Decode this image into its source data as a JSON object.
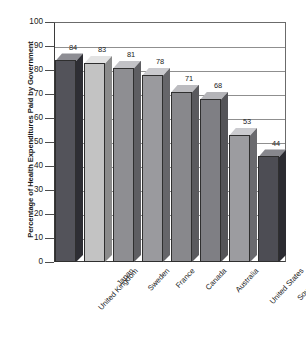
{
  "chart_data": {
    "type": "bar",
    "title": "",
    "subtitle": "",
    "xlabel": "",
    "ylabel": "Percentage of Health Expenditures Paid by Government",
    "ylim": [
      0,
      100
    ],
    "ytick_step": 10,
    "yticks": [
      "100",
      "90",
      "80",
      "70",
      "60",
      "50",
      "40",
      "30",
      "20",
      "10",
      "0"
    ],
    "grid": true,
    "grid_axis": "y",
    "legend": "none",
    "style": "3d-bar",
    "categories": [
      "United Kingdom",
      "Japan",
      "Sweden",
      "France",
      "Canada",
      "Australia",
      "United States",
      "South Africa"
    ],
    "values": [
      84,
      83,
      81,
      78,
      71,
      68,
      53,
      44
    ],
    "data_labels": [
      "84",
      "83",
      "81",
      "78",
      "71",
      "68",
      "53",
      "44"
    ],
    "bar_colors": [
      "#53535a",
      "#c3c3c3",
      "#8e8e92",
      "#9a9a9e",
      "#88888c",
      "#7f7f84",
      "#9c9ca0",
      "#4d4d54"
    ],
    "bar_top_colors": [
      "#8d8d93",
      "#e3e3e3",
      "#c2c2c6",
      "#cacace",
      "#bcbcc0",
      "#b4b4b8",
      "#cbcbcf",
      "#87878d"
    ],
    "bar_side_colors": [
      "#2e2e34",
      "#8b8b8b",
      "#5e5e62",
      "#66666a",
      "#5a5a5e",
      "#545458",
      "#6a6a6e",
      "#2b2b31"
    ]
  },
  "colors": {
    "axis": "#3b3b3b",
    "grid": "#8f8f8f",
    "text": "#1a1a1a",
    "background": "#ffffff"
  }
}
